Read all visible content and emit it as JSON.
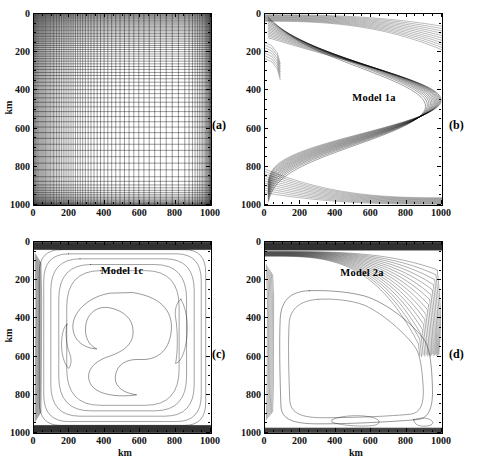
{
  "figure": {
    "panel_count": 4,
    "axis_unit": "km",
    "axis_title_x": "km",
    "axis_title_y": "km",
    "tick_values": [
      0,
      200,
      400,
      600,
      800,
      1000
    ],
    "axis_min": 0,
    "axis_max": 1000,
    "line_color": "#000000",
    "background": "#ffffff"
  },
  "panels": [
    {
      "letter": "(a)",
      "name": "computational-grid",
      "model_label": "",
      "xlabel": "km",
      "ylabel": "km",
      "xticks": [
        0,
        200,
        400,
        600,
        800,
        1000
      ],
      "yticks": [
        0,
        200,
        400,
        600,
        800,
        1000
      ],
      "xtick_labels": [
        "0",
        "200",
        "400",
        "600",
        "800",
        "1000"
      ],
      "ytick_labels": [
        "0",
        "200",
        "400",
        "600",
        "800",
        "1000"
      ]
    },
    {
      "letter": "(b)",
      "name": "model-1a-contours",
      "model_label": "Model 1a",
      "xlabel": "km",
      "ylabel": "km",
      "xticks": [
        0,
        200,
        400,
        600,
        800,
        1000
      ],
      "yticks": [
        0,
        200,
        400,
        600,
        800,
        1000
      ],
      "xtick_labels": [
        "0",
        "200",
        "400",
        "600",
        "800",
        "1000"
      ],
      "ytick_labels": [
        "0",
        "200",
        "400",
        "600",
        "800",
        "1000"
      ]
    },
    {
      "letter": "(c)",
      "name": "model-1c-contours",
      "model_label": "Model 1c",
      "xlabel": "km",
      "ylabel": "km",
      "xticks": [
        0,
        200,
        400,
        600,
        800,
        1000
      ],
      "yticks": [
        0,
        200,
        400,
        600,
        800,
        1000
      ],
      "xtick_labels": [
        "0",
        "200",
        "400",
        "600",
        "800",
        "1000"
      ],
      "ytick_labels": [
        "0",
        "200",
        "400",
        "600",
        "800",
        "1000"
      ]
    },
    {
      "letter": "(d)",
      "name": "model-2a-contours",
      "model_label": "Model 2a",
      "xlabel": "km",
      "ylabel": "km",
      "xticks": [
        0,
        200,
        400,
        600,
        800,
        1000
      ],
      "yticks": [
        0,
        200,
        400,
        600,
        800,
        1000
      ],
      "xtick_labels": [
        "0",
        "200",
        "400",
        "600",
        "800",
        "1000"
      ],
      "ytick_labels": [
        "0",
        "200",
        "400",
        "600",
        "800",
        "1000"
      ]
    }
  ],
  "chart_data": [
    {
      "type": "line",
      "subplot": "a",
      "title": "",
      "annotation": "(a)",
      "xlabel": "km",
      "ylabel": "km",
      "xlim": [
        0,
        1000
      ],
      "ylim": [
        1000,
        0
      ],
      "y_inverted": true,
      "grid": true,
      "description": "Non-uniform computational mesh: grid lines strongly refined (clustered) within about 100 km of all four boundaries, coarse and uniform in the interior",
      "grid_x_lines": [
        0,
        4,
        8,
        13,
        18,
        23,
        28,
        34,
        40,
        46,
        52,
        58,
        65,
        72,
        79,
        86,
        94,
        102,
        110,
        118,
        127,
        136,
        145,
        155,
        165,
        175,
        186,
        197,
        209,
        221,
        234,
        247,
        261,
        275,
        290,
        306,
        322,
        339,
        357,
        376,
        396,
        417,
        439,
        462,
        486,
        511,
        537,
        564,
        592,
        621,
        651,
        682,
        714,
        747,
        781,
        816,
        852,
        876,
        895,
        910,
        923,
        934,
        944,
        953,
        961,
        968,
        974,
        979,
        984,
        988,
        992,
        995,
        998,
        1000
      ],
      "grid_y_lines": [
        0,
        4,
        8,
        13,
        18,
        23,
        28,
        34,
        40,
        46,
        52,
        58,
        65,
        72,
        79,
        86,
        94,
        102,
        110,
        118,
        127,
        136,
        145,
        155,
        165,
        175,
        186,
        197,
        209,
        221,
        234,
        247,
        261,
        275,
        290,
        306,
        322,
        339,
        357,
        376,
        396,
        417,
        439,
        462,
        486,
        511,
        537,
        564,
        592,
        621,
        651,
        682,
        714,
        747,
        781,
        816,
        852,
        876,
        895,
        910,
        923,
        934,
        944,
        953,
        961,
        968,
        974,
        979,
        984,
        988,
        992,
        995,
        998,
        1000
      ]
    },
    {
      "type": "line",
      "subplot": "b",
      "title": "Model 1a",
      "annotation": "(b)",
      "xlabel": "km",
      "ylabel": "km",
      "xlim": [
        0,
        1000
      ],
      "ylim": [
        1000,
        0
      ],
      "y_inverted": true,
      "grid": false,
      "description": "Streamfunction contours of a wind-driven double-gyre; contour lines crowd along the northern and southern boundaries and along the eastern boundary, forming an S-shaped (sigmoid) inter-gyre separation through the basin centre",
      "contour_count": 14
    },
    {
      "type": "line",
      "subplot": "c",
      "title": "Model 1c",
      "annotation": "(c)",
      "xlabel": "km",
      "ylabel": "km",
      "xlim": [
        0,
        1000
      ],
      "ylim": [
        1000,
        0
      ],
      "y_inverted": true,
      "grid": false,
      "description": "Streamfunction contours with very strong crowding along the northern and southern boundaries and a narrow western boundary layer; a pronounced S-shaped closed contour occupies the basin interior",
      "contour_count": 12
    },
    {
      "type": "line",
      "subplot": "d",
      "title": "Model 2a",
      "annotation": "(d)",
      "xlabel": "km",
      "ylabel": "km",
      "xlim": [
        0,
        1000
      ],
      "ylim": [
        1000,
        0
      ],
      "y_inverted": true,
      "grid": false,
      "description": "Single-gyre streamfunction contours with an intense eastern boundary current; contours are tightly packed along the northern boundary and near x = 950 km, leaving a broad featureless interior",
      "contour_count": 16
    }
  ]
}
